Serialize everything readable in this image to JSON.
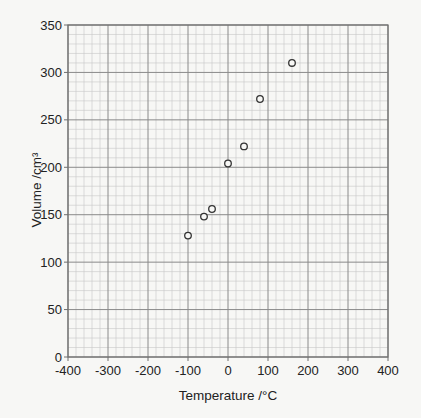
{
  "chart_data": {
    "type": "scatter",
    "title": "",
    "xlabel": "Temperature /°C",
    "ylabel": "Volume /cm³",
    "xlim": [
      -400,
      400
    ],
    "ylim": [
      0,
      350
    ],
    "x_ticks": [
      -400,
      -300,
      -200,
      -100,
      0,
      100,
      200,
      300,
      400
    ],
    "y_ticks": [
      0,
      50,
      100,
      150,
      200,
      250,
      300,
      350
    ],
    "x_minor_step": 20,
    "y_minor_step": 10,
    "grid": true,
    "marker": "open-circle",
    "series": [
      {
        "name": "measurements",
        "points": [
          {
            "x": -100,
            "y": 128
          },
          {
            "x": -60,
            "y": 148
          },
          {
            "x": -40,
            "y": 156
          },
          {
            "x": 0,
            "y": 204
          },
          {
            "x": 40,
            "y": 222
          },
          {
            "x": 80,
            "y": 272
          },
          {
            "x": 160,
            "y": 310
          }
        ]
      }
    ]
  },
  "colors": {
    "background": "#f7f7f5",
    "minor_grid": "#c8c8c8",
    "major_grid": "#8a8a8a",
    "frame": "#6e6e6e",
    "marker_stroke": "#333333"
  }
}
